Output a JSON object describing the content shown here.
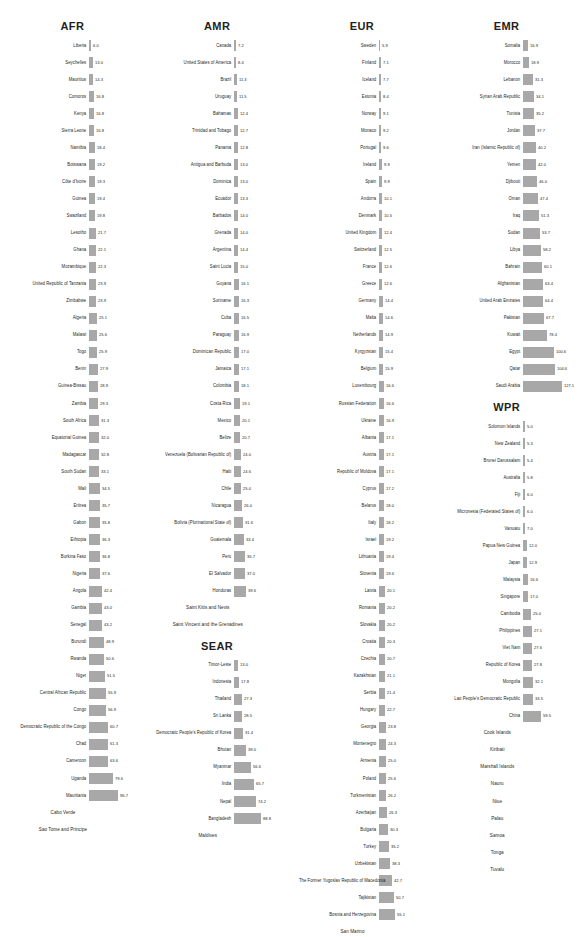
{
  "chart_data": {
    "type": "bar",
    "title": "",
    "xlabel": "",
    "ylabel": "",
    "grid": false,
    "legend": "none",
    "orientation": "horizontal",
    "bar_color": "#a8a8a8",
    "groups": [
      {
        "name": "AFR",
        "categories": [
          "Liberia",
          "Seychelles",
          "Mauritius",
          "Comoros",
          "Kenya",
          "Sierra Leone",
          "Namibia",
          "Botswana",
          "Côte d'Ivoire",
          "Guinea",
          "Swaziland",
          "Lesotho",
          "Ghana",
          "Mozambique",
          "United Republic of Tanzania",
          "Zimbabwe",
          "Algeria",
          "Malawi",
          "Togo",
          "Benin",
          "Guinea-Bissau",
          "Zambia",
          "South Africa",
          "Equatorial Guinea",
          "Madagascar",
          "South Sudan",
          "Mali",
          "Eritrea",
          "Gabon",
          "Ethiopia",
          "Burkina Faso",
          "Nigeria",
          "Angola",
          "Gambia",
          "Senegal",
          "Burundi",
          "Rwanda",
          "Niger",
          "Central African Republic",
          "Congo",
          "Democratic Republic of the Congo",
          "Chad",
          "Cameroon",
          "Uganda",
          "Mauritania",
          "Cabo Verde",
          "Sao Tome and Principe"
        ],
        "values": [
          6.0,
          13.0,
          14.3,
          16.8,
          16.8,
          16.8,
          18.4,
          19.2,
          19.3,
          19.4,
          19.8,
          21.7,
          22.1,
          22.3,
          23.9,
          23.9,
          25.1,
          25.6,
          25.9,
          27.9,
          28.9,
          29.3,
          31.3,
          32.0,
          32.8,
          33.1,
          34.5,
          35.7,
          35.8,
          36.3,
          36.8,
          37.6,
          42.4,
          43.0,
          43.2,
          48.9,
          50.6,
          51.5,
          55.9,
          56.9,
          60.7,
          61.3,
          63.6,
          79.6,
          96.7,
          null,
          null
        ]
      },
      {
        "name": "AMR",
        "categories": [
          "Canada",
          "United States of America",
          "Brazil",
          "Uruguay",
          "Bahamas",
          "Trinidad and Tobago",
          "Panama",
          "Antigua and Barbuda",
          "Dominica",
          "Ecuador",
          "Barbados",
          "Grenada",
          "Argentina",
          "Saint Lucia",
          "Guyana",
          "Suriname",
          "Cuba",
          "Paraguay",
          "Dominican Republic",
          "Jamaica",
          "Colombia",
          "Costa Rica",
          "Mexico",
          "Belize",
          "Venezuela (Bolivarian Republic of)",
          "Haiti",
          "Chile",
          "Nicaragua",
          "Bolivia (Plurinational State of)",
          "Guatemala",
          "Peru",
          "El Salvador",
          "Honduras",
          "Saint Kitts and Nevis",
          "Saint Vincent and the Grenadines"
        ],
        "values": [
          7.2,
          8.4,
          11.3,
          11.5,
          12.4,
          12.7,
          12.8,
          13.0,
          13.0,
          13.3,
          14.0,
          14.0,
          14.4,
          15.0,
          16.1,
          16.3,
          16.5,
          16.9,
          17.0,
          17.1,
          18.1,
          19.1,
          20.1,
          20.7,
          24.0,
          24.6,
          25.0,
          26.0,
          31.6,
          33.4,
          35.7,
          37.0,
          39.6,
          null,
          null
        ]
      },
      {
        "name": "SEAR",
        "categories": [
          "Timor-Leste",
          "Indonesia",
          "Thailand",
          "Sri Lanka",
          "Democratic People's Republic of Korea",
          "Bhutan",
          "Myanmar",
          "India",
          "Nepal",
          "Bangladesh",
          "Maldives"
        ],
        "values": [
          13.0,
          17.8,
          27.3,
          28.5,
          31.4,
          39.0,
          56.6,
          65.7,
          74.2,
          88.8,
          null
        ]
      },
      {
        "name": "EUR",
        "categories": [
          "Sweden",
          "Finland",
          "Iceland",
          "Estonia",
          "Norway",
          "Monaco",
          "Portugal",
          "Ireland",
          "Spain",
          "Andorra",
          "Denmark",
          "United Kingdom",
          "Switzerland",
          "France",
          "Greece",
          "Germany",
          "Malta",
          "Netherlands",
          "Kyrgyzstan",
          "Belgium",
          "Luxembourg",
          "Russian Federation",
          "Ukraine",
          "Albania",
          "Austria",
          "Republic of Moldova",
          "Cyprus",
          "Belarus",
          "Italy",
          "Israel",
          "Lithuania",
          "Slovenia",
          "Latvia",
          "Romania",
          "Slovakia",
          "Croatia",
          "Czechia",
          "Kazakhstan",
          "Serbia",
          "Hungary",
          "Georgia",
          "Montenegro",
          "Armenia",
          "Poland",
          "Turkmenistan",
          "Azerbaijan",
          "Bulgaria",
          "Turkey",
          "Uzbekistan",
          "The Former Yugoslav Republic of Macedonia",
          "Tajikistan",
          "Bosnia and Herzegovina",
          "San Marino"
        ],
        "values": [
          5.9,
          7.1,
          7.7,
          8.4,
          9.1,
          9.2,
          9.6,
          9.9,
          9.9,
          10.1,
          10.5,
          12.4,
          12.5,
          12.6,
          12.6,
          14.4,
          14.6,
          14.9,
          15.4,
          15.9,
          16.6,
          16.6,
          16.9,
          17.1,
          17.1,
          17.1,
          17.2,
          18.0,
          18.2,
          19.2,
          19.4,
          19.6,
          20.1,
          20.2,
          20.2,
          20.3,
          20.7,
          21.1,
          21.4,
          22.7,
          23.8,
          24.3,
          25.0,
          25.6,
          26.2,
          26.3,
          30.3,
          35.2,
          38.3,
          42.7,
          50.7,
          55.1,
          null
        ]
      },
      {
        "name": "EMR",
        "categories": [
          "Somalia",
          "Morocco",
          "Lebanon",
          "Syrian Arab Republic",
          "Tunisia",
          "Jordan",
          "Iran (Islamic Republic of)",
          "Yemen",
          "Djibouti",
          "Oman",
          "Iraq",
          "Sudan",
          "Libya",
          "Bahrain",
          "Afghanistan",
          "United Arab Emirates",
          "Pakistan",
          "Kuwait",
          "Egypt",
          "Qatar",
          "Saudi Arabia"
        ],
        "values": [
          16.9,
          18.9,
          31.3,
          34.1,
          35.2,
          37.7,
          40.2,
          42.0,
          46.0,
          47.4,
          51.3,
          53.7,
          58.2,
          60.1,
          63.4,
          64.4,
          67.7,
          78.4,
          100.6,
          104.6,
          127.1
        ]
      },
      {
        "name": "WPR",
        "categories": [
          "Solomon Islands",
          "New Zealand",
          "Brunei Darussalam",
          "Australia",
          "Fiji",
          "Micronesia (Federated States of)",
          "Vanuatu",
          "Papua New Guinea",
          "Japan",
          "Malaysia",
          "Singapore",
          "Cambodia",
          "Philippines",
          "Viet Nam",
          "Republic of Korea",
          "Mongolia",
          "Lao People's Democratic Republic",
          "China",
          "Cook Islands",
          "Kiribati",
          "Marshall Islands",
          "Nauru",
          "Niue",
          "Palau",
          "Samoa",
          "Tonga",
          "Tuvalu"
        ],
        "values": [
          5.0,
          5.3,
          5.4,
          5.8,
          6.0,
          6.0,
          7.0,
          12.0,
          12.9,
          16.6,
          17.0,
          25.0,
          27.1,
          27.6,
          27.8,
          32.1,
          33.5,
          59.5,
          null,
          null,
          null,
          null,
          null,
          null,
          null,
          null,
          null
        ]
      }
    ]
  }
}
